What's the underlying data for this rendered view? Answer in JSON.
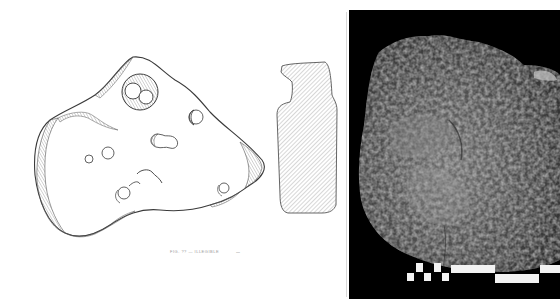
{
  "figure": {
    "type": "archaeological-artifact-plate",
    "panels": [
      {
        "id": "plan-drawing",
        "description": "line drawing, plan view with perforations"
      },
      {
        "id": "section-drawing",
        "description": "hatched cross-section profile"
      },
      {
        "id": "photograph",
        "description": "black-and-white photograph on black background"
      }
    ],
    "caption": "FIG. ?? — ILLEGIBLE",
    "scale_label": "—",
    "colors": {
      "background": "#ffffff",
      "line": "#3a3a3a",
      "hatch": "#8a8a8a",
      "photo_bg": "#000000",
      "scale_white": "#f2f2f2"
    },
    "scalebar": {
      "pattern": "alternating checkered segments",
      "segments": 8
    }
  }
}
